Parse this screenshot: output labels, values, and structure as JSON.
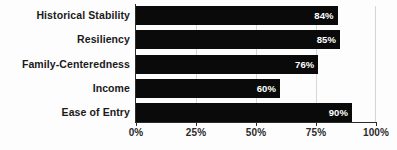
{
  "chart_data": {
    "type": "bar",
    "orientation": "horizontal",
    "title": "",
    "subtitle": "",
    "xlabel": "",
    "ylabel": "",
    "xlim": [
      0,
      100
    ],
    "grid": true,
    "legend": null,
    "categories": [
      "Historical Stability",
      "Resiliency",
      "Family-Centeredness",
      "Income",
      "Ease of Entry"
    ],
    "values": [
      84,
      85,
      76,
      60,
      90
    ],
    "value_labels": [
      "84%",
      "85%",
      "76%",
      "60%",
      "90%"
    ],
    "x_ticks": [
      0,
      25,
      50,
      75,
      100
    ],
    "x_tick_labels": [
      "0%",
      "25%",
      "50%",
      "75%",
      "100%"
    ],
    "colors": {
      "bar": "#0a0a0a",
      "bar_label_text": "#ffffff",
      "category_label_text": "#1a1a1a",
      "axis": "#2b2b2b",
      "gridline": "#d6d6d6",
      "background": "#fdfdfd"
    }
  }
}
